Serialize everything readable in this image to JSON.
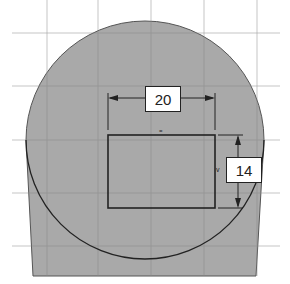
{
  "sketch": {
    "colors": {
      "background": "#ffffff",
      "fill": "#a9a9a9",
      "grid": "#8c8c8c",
      "outline": "#222222"
    },
    "dimensions": [
      {
        "id": "width",
        "value": "20"
      },
      {
        "id": "height",
        "value": "14"
      }
    ],
    "constraint_marks": [
      {
        "id": "horizontal",
        "glyph": "="
      },
      {
        "id": "vertical",
        "glyph": "v"
      }
    ]
  }
}
